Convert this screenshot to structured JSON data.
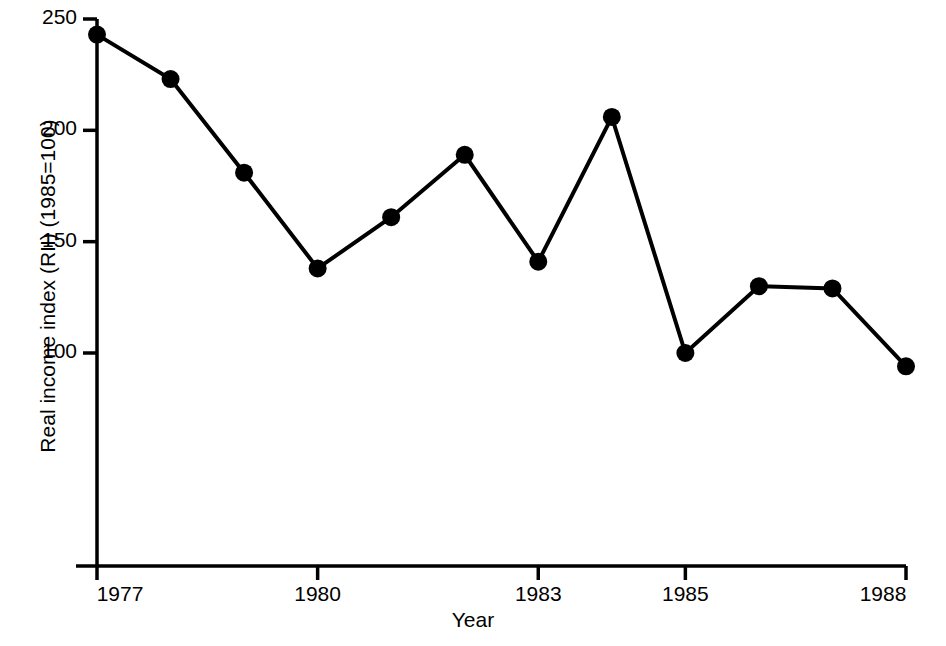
{
  "chart_data": {
    "type": "line",
    "title": "",
    "xlabel": "Year",
    "ylabel": "Real income index (RII) (1985=100)",
    "x": [
      1977,
      1978,
      1979,
      1980,
      1981,
      1982,
      1983,
      1984,
      1985,
      1986,
      1987,
      1988
    ],
    "values": [
      243,
      223,
      181,
      138,
      161,
      189,
      141,
      206,
      100,
      130,
      129,
      94
    ],
    "series": [
      {
        "name": "Real income index (RII)",
        "values": [
          243,
          223,
          181,
          138,
          161,
          189,
          141,
          206,
          100,
          130,
          129,
          94
        ]
      }
    ],
    "xlim": [
      1977,
      1988
    ],
    "ylim": [
      72,
      250
    ],
    "xticks": [
      1977,
      1980,
      1983,
      1985,
      1988
    ],
    "xtick_labels": [
      "1977",
      "1980",
      "1983",
      "1985",
      "1988"
    ],
    "yticks": [
      100,
      150,
      200,
      250
    ],
    "ytick_labels": [
      "100",
      "150",
      "200",
      "250"
    ],
    "grid": false,
    "legend": false,
    "marker": "filled-circle",
    "line_color": "#000000",
    "marker_color": "#000000",
    "background_color": "#ffffff"
  },
  "axes": {
    "y_title": "Real income index (RII) (1985=100)",
    "x_title": "Year"
  }
}
